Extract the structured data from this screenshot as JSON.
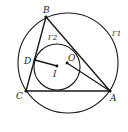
{
  "diagram": {
    "type": "geometry",
    "points": {
      "A": "A",
      "B": "B",
      "C": "C",
      "D": "D",
      "I": "I",
      "O": "O"
    },
    "circles": {
      "circumcircle": "Γ1",
      "incircle": "Γ2"
    },
    "segments": [
      "AB",
      "BC",
      "CA",
      "DI",
      "OA"
    ]
  }
}
